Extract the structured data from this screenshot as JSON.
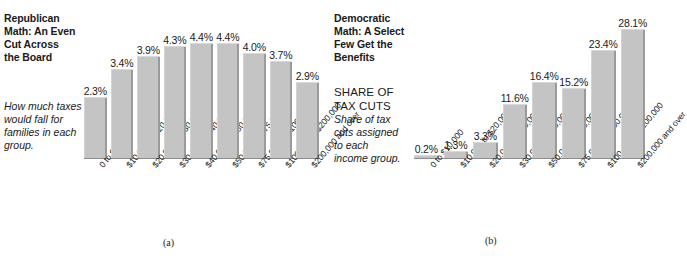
{
  "figure": {
    "panels": [
      {
        "key": "a",
        "caption": "(a)",
        "headline": "Republican\nMath: An Even\nCut Across\nthe Board",
        "kicker": "",
        "blurb": "How much taxes\nwould fall for\nfamilies in each\ngroup.",
        "chart_data": {
          "type": "bar",
          "title": "Republican Math: An Even Cut Across the Board",
          "xlabel": "",
          "ylabel": "",
          "ylim": [
            0,
            4.4
          ],
          "grid": false,
          "legend": "none",
          "value_suffix": "%",
          "categories": [
            "0 to $10,000",
            "$10,000 to $20,000",
            "$20,000 to $30,000",
            "$30,000 to $40,000",
            "$40,000 to $50,000",
            "$50,000 to $75,000",
            "$75,000 to $100,000",
            "$100,000 to $200,000",
            "$200,000 and over"
          ],
          "values": [
            2.3,
            3.4,
            3.9,
            4.3,
            4.4,
            4.4,
            4.0,
            3.7,
            2.9
          ],
          "labels": [
            "2.3%",
            "3.4%",
            "3.9%",
            "4.3%",
            "4.4%",
            "4.4%",
            "4.0%",
            "3.7%",
            "2.9%"
          ]
        }
      },
      {
        "key": "b",
        "caption": "(b)",
        "headline": "Democratic\nMath: A Select\nFew Get the\nBenefits",
        "kicker": "SHARE OF\nTAX CUTS",
        "blurb": "Share of tax\ncuts assigned\nto each\nincome group.",
        "chart_data": {
          "type": "bar",
          "title": "Democratic Math: A Select Few Get the Benefits",
          "xlabel": "",
          "ylabel": "",
          "ylim": [
            0,
            28.1
          ],
          "grid": false,
          "legend": "none",
          "value_suffix": "%",
          "categories": [
            "0 to $10,000",
            "$10,000 to $20,000",
            "$20,000 to $30,000",
            "$30,000 to $50,000",
            "$50,000 to $75,000",
            "$75,000 to $100,000",
            "$100,000 to $200,000",
            "$200,000 and over"
          ],
          "values": [
            0.2,
            1.3,
            3.3,
            11.6,
            16.4,
            15.2,
            23.4,
            28.1
          ],
          "labels": [
            "0.2%",
            "1.3%",
            "3.3%",
            "11.6%",
            "16.4%",
            "15.2%",
            "23.4%",
            "28.1%"
          ]
        }
      }
    ]
  },
  "colors": {
    "bar_fill": "#c4c4c4",
    "bar_shadow": "#9a9a9a",
    "text": "#1a1a1a",
    "background": "#ffffff"
  }
}
